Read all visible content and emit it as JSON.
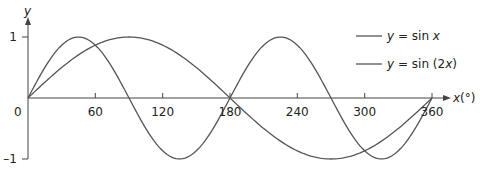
{
  "chart_data": {
    "type": "line",
    "title": "",
    "xlabel": "x(°)",
    "ylabel": "y",
    "xlim": [
      0,
      360
    ],
    "ylim": [
      -1,
      1
    ],
    "x_ticks": [
      "0",
      "60",
      "120",
      "180",
      "240",
      "300",
      "360"
    ],
    "y_ticks": [
      "1",
      "-1"
    ],
    "grid": false,
    "legend_position": "upper right",
    "series": [
      {
        "name": "y = sin x",
        "x": [
          0,
          45,
          90,
          135,
          180,
          225,
          270,
          315,
          360
        ],
        "values": [
          0,
          0.707,
          1,
          0.707,
          0,
          -0.707,
          -1,
          -0.707,
          0
        ]
      },
      {
        "name": "y = sin (2x)",
        "x": [
          0,
          45,
          90,
          135,
          180,
          225,
          270,
          315,
          360
        ],
        "values": [
          0,
          1,
          0,
          -1,
          0,
          1,
          0,
          -1,
          0
        ]
      }
    ]
  },
  "axis": {
    "y_label": "y",
    "x_label_var": "x",
    "x_label_unit": "(°)",
    "y_tick_pos": "1",
    "y_tick_neg": "–1",
    "origin": "0",
    "x_ticks": [
      "60",
      "120",
      "180",
      "240",
      "300",
      "360"
    ]
  },
  "legend": {
    "item1_prefix": "y",
    "item1_mid": " = sin ",
    "item1_var": "x",
    "item2_prefix": "y",
    "item2_mid": " = sin (2",
    "item2_var": "x",
    "item2_end": ")"
  },
  "colors": {
    "curve": "#555555",
    "axis": "#444444"
  }
}
